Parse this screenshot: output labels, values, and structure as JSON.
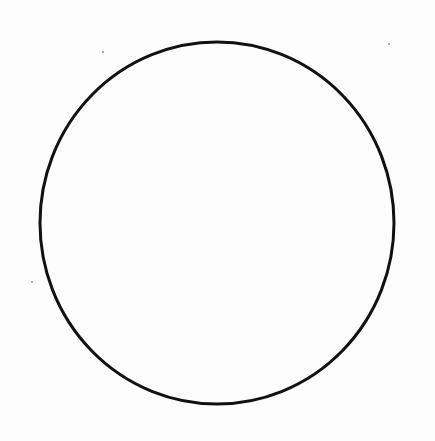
{
  "diagram": {
    "shape": "circle",
    "center": {
      "x": 217,
      "y": 223
    },
    "radius_x": 177,
    "radius_y": 181,
    "stroke_width": 3,
    "stroke_color": "#111111",
    "fill": "none",
    "background_color": "#fdfdfd"
  },
  "specks": [
    {
      "x": 102,
      "y": 51
    },
    {
      "x": 388,
      "y": 43
    },
    {
      "x": 31,
      "y": 281
    }
  ]
}
